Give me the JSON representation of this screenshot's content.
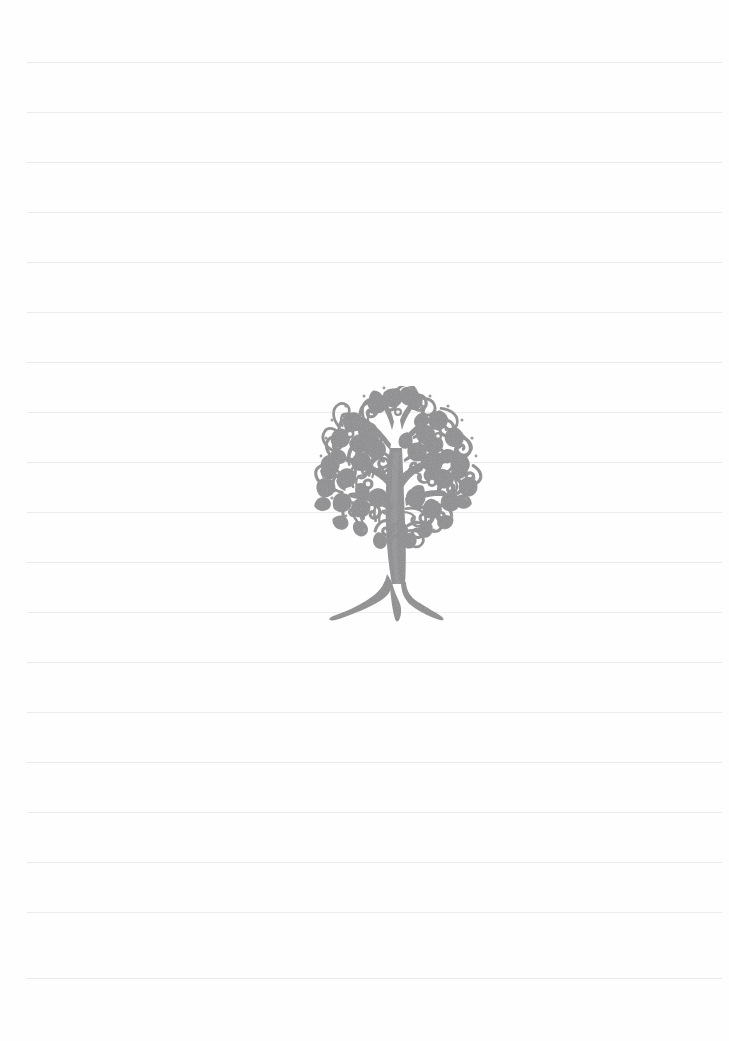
{
  "page": {
    "kind": "lined-notebook-page",
    "width": 729,
    "height": 1041,
    "background_color": "#fefefe",
    "text_content": "",
    "has_visible_text": false
  },
  "ruling": {
    "name": "ruled-lines",
    "line_color": "#e9e9ec",
    "line_thickness": 1,
    "line_spacing": 50,
    "first_line_y": 62,
    "left_margin_x": 27,
    "right_margin_x": 722,
    "line_count": 19,
    "line_positions": [
      62,
      112,
      162,
      212,
      262,
      312,
      362,
      412,
      462,
      512,
      562,
      612,
      662,
      712,
      762,
      812,
      862,
      912,
      978
    ]
  },
  "illustration": {
    "name": "decorative-tree",
    "description": "Ornate filigree tree with swirling paisley foliage, forked trunk and flared roots",
    "color": "#8e8e90",
    "accent_color": "#9a9a9c",
    "x": 306,
    "y": 386,
    "width": 186,
    "height": 240,
    "center_x": 398,
    "canopy_top_y": 390,
    "canopy_left_x": 312,
    "canopy_right_x": 485,
    "trunk_base_y": 622
  }
}
